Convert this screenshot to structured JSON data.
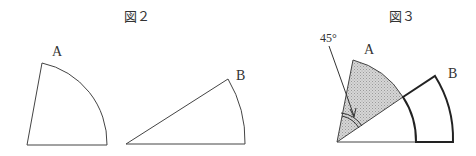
{
  "figure2": {
    "caption": "図２",
    "shape_a_label": "A",
    "shape_b_label": "B"
  },
  "figure3": {
    "caption": "図３",
    "angle_label": "45°",
    "shape_a_label": "A",
    "shape_b_label": "B"
  },
  "colors": {
    "stroke": "#333333",
    "shade": "#c8c8c8"
  }
}
